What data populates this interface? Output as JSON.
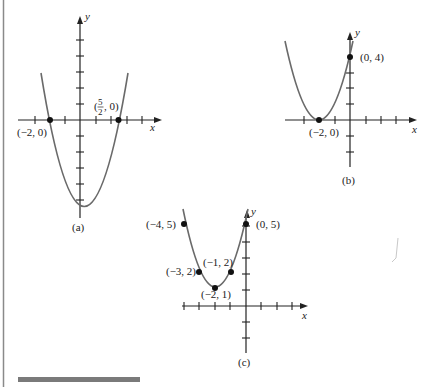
{
  "figure": {
    "graphs": [
      {
        "id": "a",
        "caption": "(a)",
        "x_axis_label": "x",
        "y_axis_label": "y",
        "equation_points": [
          "(-2, 0)",
          "(5/2, 0)"
        ],
        "labels": {
          "p1": "(−2, 0)",
          "p2_open": "(",
          "p2_num": "5",
          "p2_den": "2",
          "p2_close": ", 0)"
        }
      },
      {
        "id": "b",
        "caption": "(b)",
        "x_axis_label": "x",
        "y_axis_label": "y",
        "labels": {
          "p1": "(−2, 0)",
          "p2": "(0, 4)"
        }
      },
      {
        "id": "c",
        "caption": "(c)",
        "x_axis_label": "x",
        "y_axis_label": "y",
        "labels": {
          "p1": "(−4, 5)",
          "p2": "(−3, 2)",
          "p3": "(−2, 1)",
          "p4": "(−1, 2)",
          "p5": "(0, 5)"
        }
      }
    ],
    "colors": {
      "axis": "#222222",
      "curve": "#6a6a6a",
      "point": "#111111",
      "rule": "#7a7a7a"
    }
  }
}
